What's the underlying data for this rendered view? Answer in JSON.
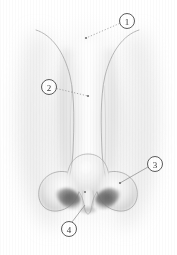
{
  "figure": {
    "style": "grayscale pencil / airbrush medical illustration",
    "background_color": "#ffffff",
    "ink_color": "#9a9a9a",
    "label_color": "#3a3a3a",
    "width": 177,
    "height": 255
  },
  "markers": [
    {
      "id": "marker-1",
      "label": "1",
      "glyph": "①",
      "circle": {
        "cx": 127,
        "cy": 21,
        "r": 7.5
      },
      "leader": {
        "x1": 119.5,
        "y1": 23.5,
        "x2": 86,
        "y2": 38
      },
      "endpoint": {
        "x": 86,
        "y": 38,
        "r": 1.1
      },
      "dotted": true,
      "anatomy": "nasal root / radix"
    },
    {
      "id": "marker-2",
      "label": "2",
      "circle": {
        "cx": 49,
        "cy": 87,
        "r": 7.5
      },
      "leader": {
        "x1": 56.5,
        "y1": 88.5,
        "x2": 88,
        "y2": 96
      },
      "endpoint": {
        "x": 88,
        "y": 96,
        "r": 1.1
      },
      "dotted": true,
      "anatomy": "nasal dorsum / lateral nasal wall"
    },
    {
      "id": "marker-3",
      "label": "3",
      "circle": {
        "cx": 155,
        "cy": 164,
        "r": 7.5
      },
      "leader": {
        "x1": 148,
        "y1": 167,
        "x2": 120,
        "y2": 183
      },
      "endpoint": {
        "x": 120,
        "y": 183,
        "r": 1.1
      },
      "dotted": false,
      "anatomy": "ala of nose / nostril wing"
    },
    {
      "id": "marker-4",
      "label": "4",
      "circle": {
        "cx": 69,
        "cy": 229,
        "r": 7.5
      },
      "leader": {
        "x1": 72,
        "y1": 222,
        "x2": 85,
        "y2": 205
      },
      "endpoint": {
        "x": 85,
        "y": 205,
        "r": 0
      },
      "dotted": false,
      "anatomy": "columella / nasal base"
    }
  ],
  "callout_dots": [
    {
      "id": "dot-dorsum",
      "x": 85,
      "y": 192,
      "r": 1.0
    }
  ]
}
